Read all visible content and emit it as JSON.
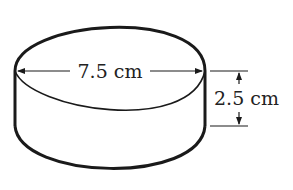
{
  "diagram": {
    "shape": "cylinder",
    "diameter_label": "7.5 cm",
    "height_label": "2.5 cm",
    "stroke_color": "#1a1a1a"
  }
}
